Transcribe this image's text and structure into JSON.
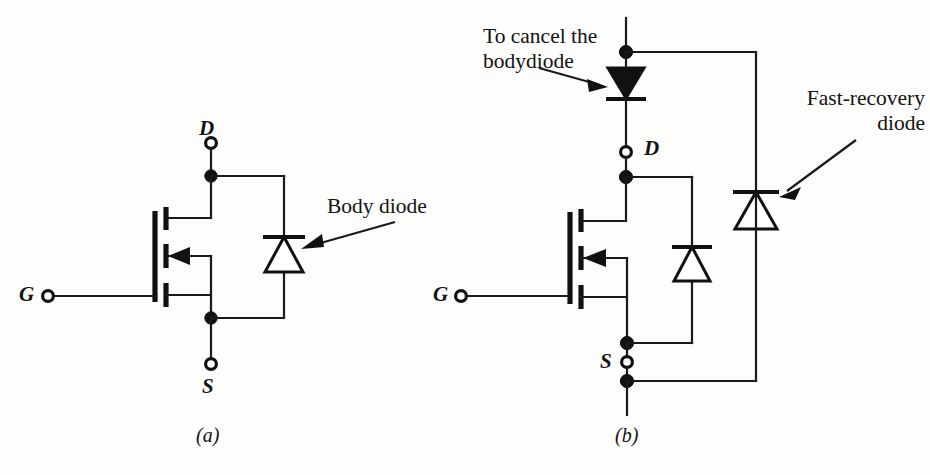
{
  "figure": {
    "type": "circuit-diagram",
    "background_color": "#fdfdfc",
    "line_color": "#111111"
  },
  "subfigures": [
    {
      "id": "a",
      "label": "(a)",
      "caption_x": 196,
      "caption_y": 424
    },
    {
      "id": "b",
      "label": "(b)",
      "caption_x": 615,
      "caption_y": 424
    }
  ],
  "circuit_a": {
    "name": "MOSFET with intrinsic body diode",
    "terminals": [
      {
        "name": "drain",
        "label": "D",
        "label_x": 200,
        "label_y": 118,
        "marker": "open-circle",
        "cx": 211,
        "cy": 143
      },
      {
        "name": "source",
        "label": "S",
        "label_x": 202,
        "label_y": 378,
        "marker": "open-circle",
        "cx": 211,
        "cy": 364
      },
      {
        "name": "gate",
        "label": "G",
        "label_x": 20,
        "label_y": 284,
        "marker": "open-circle",
        "cx": 48,
        "cy": 296
      }
    ],
    "components": [
      {
        "name": "mosfet",
        "type": "n-channel-mosfet",
        "arrow_direction": "left"
      },
      {
        "name": "body-diode",
        "type": "diode",
        "triangle_fill": "open",
        "triangle_direction": "up",
        "cathode": "top",
        "x": 284,
        "bar_y": 237
      }
    ],
    "callouts": [
      {
        "name": "body-diode-callout",
        "text": "Body diode",
        "lines": [
          "Body diode"
        ],
        "text_x": 327,
        "text_y": 196,
        "arrow_from_x": 395,
        "arrow_from_y": 222,
        "arrow_to_x": 303,
        "arrow_to_y": 248
      }
    ]
  },
  "circuit_b": {
    "name": "MOSFET with series cancelling diode and parallel fast-recovery diode",
    "terminals": [
      {
        "name": "drain",
        "label": "D",
        "label_x": 645,
        "label_y": 137,
        "marker": "open-circle",
        "cx": 626,
        "cy": 152
      },
      {
        "name": "source",
        "label": "S",
        "label_x": 601,
        "label_y": 352,
        "marker": "open-circle",
        "cx": 627,
        "cy": 362
      },
      {
        "name": "gate",
        "label": "G",
        "label_x": 434,
        "label_y": 284,
        "marker": "open-circle",
        "cx": 461,
        "cy": 296
      }
    ],
    "components": [
      {
        "name": "cancel-body-diode",
        "type": "diode",
        "triangle_fill": "filled",
        "triangle_direction": "down",
        "cathode": "bottom",
        "x": 626,
        "bar_y": 98
      },
      {
        "name": "mosfet",
        "type": "n-channel-mosfet",
        "arrow_direction": "left"
      },
      {
        "name": "body-diode",
        "type": "diode",
        "triangle_fill": "open",
        "triangle_direction": "up",
        "cathode": "top",
        "x": 692,
        "bar_y": 247
      },
      {
        "name": "fast-recovery-diode",
        "type": "diode",
        "triangle_fill": "open",
        "triangle_direction": "up",
        "cathode": "top",
        "x": 756,
        "bar_y": 192
      }
    ],
    "nodes": [
      {
        "name": "top-node",
        "x": 626,
        "y": 52
      },
      {
        "name": "drain-node",
        "x": 626,
        "y": 177
      },
      {
        "name": "source-node",
        "x": 627,
        "y": 343
      },
      {
        "name": "bottom-node",
        "x": 627,
        "y": 381
      }
    ],
    "callouts": [
      {
        "name": "cancel-bodydiode-callout",
        "text": "To cancel the bodydiode",
        "lines": [
          "To cancel the",
          "bodydiode"
        ],
        "text_x": 483,
        "text_y": 26,
        "arrow_from_x": 539,
        "arrow_from_y": 68,
        "arrow_to_x": 605,
        "arrow_to_y": 86
      },
      {
        "name": "fast-recovery-diode-callout",
        "text": "Fast-recovery diode",
        "lines": [
          "Fast-recovery",
          "diode"
        ],
        "text_x": 790,
        "text_y": 88,
        "arrow_from_x": 856,
        "arrow_from_y": 140,
        "arrow_to_x": 779,
        "arrow_to_y": 196
      }
    ]
  }
}
